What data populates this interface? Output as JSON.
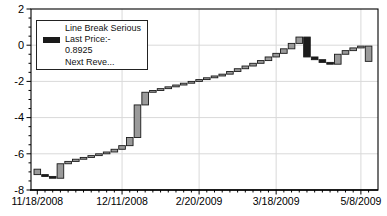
{
  "legend": {
    "series_label": "Line Break Serious",
    "last_price_label": "Last Price:-",
    "last_price_value": "0.8925",
    "next_line": "Next Reve...",
    "swatch_color": "#1a1a1a"
  },
  "chart_data": {
    "type": "bar",
    "subtype": "line-break",
    "title": "",
    "xlabel": "",
    "ylabel": "",
    "y_axis": {
      "min": -8,
      "max": 2,
      "major_step": 2,
      "minor_step": 0.5,
      "tick_values": [
        2,
        0,
        -2,
        -4,
        -6,
        -8
      ],
      "tick_labels": [
        "2",
        "0",
        "-2",
        "-4",
        "-6",
        "-8"
      ]
    },
    "x_axis": {
      "labels": [
        "11/18/2008",
        "12/11/2008",
        "2/20/2009",
        "3/18/2009",
        "5/8/2009"
      ],
      "label_indices": [
        0,
        11,
        21,
        31,
        42
      ],
      "gridline_indices": [
        11,
        21,
        31,
        42
      ]
    },
    "grid": {
      "h_values": [
        0,
        -2,
        -4,
        -6
      ]
    },
    "last_price": -0.8925,
    "bars": [
      [
        -7.15,
        -6.85,
        "g"
      ],
      [
        -7.15,
        -7.25,
        "k"
      ],
      [
        -7.25,
        -7.35,
        "k"
      ],
      [
        -7.35,
        -6.55,
        "g"
      ],
      [
        -6.55,
        -6.42,
        "g"
      ],
      [
        -6.42,
        -6.3,
        "g"
      ],
      [
        -6.3,
        -6.2,
        "g"
      ],
      [
        -6.2,
        -6.1,
        "g"
      ],
      [
        -6.1,
        -6.0,
        "g"
      ],
      [
        -6.0,
        -5.9,
        "g"
      ],
      [
        -5.9,
        -5.75,
        "g"
      ],
      [
        -5.75,
        -5.55,
        "g"
      ],
      [
        -5.55,
        -5.1,
        "g"
      ],
      [
        -5.1,
        -3.3,
        "g"
      ],
      [
        -3.3,
        -2.6,
        "g"
      ],
      [
        -2.6,
        -2.5,
        "g"
      ],
      [
        -2.5,
        -2.4,
        "g"
      ],
      [
        -2.4,
        -2.3,
        "g"
      ],
      [
        -2.3,
        -2.2,
        "g"
      ],
      [
        -2.2,
        -2.1,
        "g"
      ],
      [
        -2.1,
        -2.0,
        "g"
      ],
      [
        -2.0,
        -1.9,
        "g"
      ],
      [
        -1.9,
        -1.8,
        "g"
      ],
      [
        -1.8,
        -1.7,
        "g"
      ],
      [
        -1.7,
        -1.6,
        "g"
      ],
      [
        -1.6,
        -1.45,
        "g"
      ],
      [
        -1.45,
        -1.3,
        "g"
      ],
      [
        -1.3,
        -1.15,
        "g"
      ],
      [
        -1.15,
        -1.0,
        "g"
      ],
      [
        -1.0,
        -0.85,
        "g"
      ],
      [
        -0.85,
        -0.65,
        "g"
      ],
      [
        -0.65,
        -0.45,
        "g"
      ],
      [
        -0.45,
        -0.2,
        "g"
      ],
      [
        -0.2,
        0.1,
        "g"
      ],
      [
        0.1,
        0.45,
        "g"
      ],
      [
        0.45,
        -0.65,
        "k"
      ],
      [
        -0.65,
        -0.8,
        "k"
      ],
      [
        -0.8,
        -0.95,
        "k"
      ],
      [
        -0.95,
        -1.05,
        "k"
      ],
      [
        -1.05,
        -0.5,
        "g"
      ],
      [
        -0.5,
        -0.3,
        "g"
      ],
      [
        -0.3,
        -0.15,
        "g"
      ],
      [
        -0.15,
        -0.05,
        "g"
      ],
      [
        -0.05,
        -0.8925,
        "g"
      ]
    ],
    "colors": {
      "up_fill": "#9a9a9a",
      "down_fill": "#1c1c1c",
      "border": "#1a1a1a",
      "grid": "#d9d9d9",
      "axis": "#000000",
      "background": "#ffffff",
      "text": "#000000"
    }
  }
}
